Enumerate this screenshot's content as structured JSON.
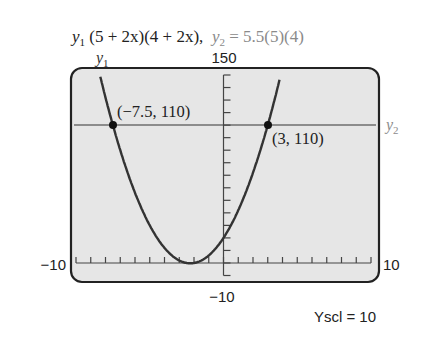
{
  "title": {
    "y1_eq": "(5 + 2x)(4 + 2x),",
    "y2_eq": "= 5.5(5)(4)"
  },
  "labels": {
    "y1_label": "y",
    "y1_sub": "1",
    "y2_label": "y",
    "y2_sub": "2",
    "ymax": "150",
    "ymin": "−10",
    "xmin": "−10",
    "xmax": "10",
    "yscl": "Yscl = 10",
    "point_left": "(−7.5, 110)",
    "point_right": "(3, 110)"
  },
  "colors": {
    "screen_bg": "#e6e6e6",
    "frame": "#222222",
    "curve": "#333333",
    "hline": "#8c8c8c",
    "axis": "#444444"
  },
  "chart_data": {
    "type": "line",
    "xlabel": "",
    "ylabel": "",
    "xlim": [
      -10,
      10
    ],
    "ylim": [
      -10,
      150
    ],
    "xscl": 1,
    "yscl": 10,
    "series": [
      {
        "name": "y1",
        "expression": "(5 + 2x)(4 + 2x)",
        "x": [
          -8.5,
          -8,
          -7.5,
          -7,
          -6,
          -5,
          -4.5,
          -4,
          -3,
          -2,
          -1,
          0,
          1,
          2,
          3,
          3.5
        ],
        "values": [
          132,
          120,
          110,
          90,
          56,
          30,
          -0.25,
          0,
          2,
          0,
          6,
          20,
          42,
          72,
          110,
          132
        ]
      },
      {
        "name": "y2",
        "expression": "5.5(5)(4)",
        "x": [
          -10,
          10
        ],
        "values": [
          110,
          110
        ]
      }
    ],
    "annotations": [
      {
        "text": "(−7.5, 110)",
        "x": -7.5,
        "y": 110
      },
      {
        "text": "(3, 110)",
        "x": 3,
        "y": 110
      }
    ],
    "grid": false
  }
}
